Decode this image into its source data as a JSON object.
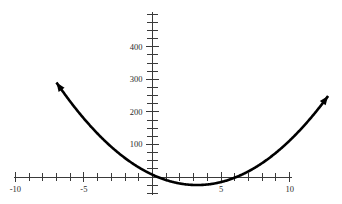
{
  "figure": {
    "title": "",
    "background_color": "#ffffff",
    "curve_color": "#000000",
    "axis_color": "#3a3a3a",
    "label_color": "#2b2b2b",
    "width": 342,
    "height": 204
  },
  "chart_data": {
    "type": "line",
    "title": "",
    "xlabel": "",
    "ylabel": "",
    "grid": false,
    "legend": null,
    "xlim": [
      -10.5,
      11.5
    ],
    "ylim": [
      -40,
      500
    ],
    "x_axis": {
      "labeled_ticks": [
        -10,
        -5,
        5,
        10
      ],
      "labeled_tick_texts": [
        "-10",
        "-5",
        "5",
        "10"
      ],
      "minor_tick_step": 1,
      "minor_ticks": [
        -10,
        -9,
        -8,
        -7,
        -6,
        -5,
        -4,
        -3,
        -2,
        -1,
        0,
        1,
        2,
        3,
        4,
        5,
        6,
        7,
        8,
        9,
        10
      ],
      "axis_value": 0
    },
    "y_axis": {
      "labeled_ticks": [
        100,
        200,
        300,
        400
      ],
      "labeled_tick_texts": [
        "100",
        "200",
        "300",
        "400"
      ],
      "minor_tick_step": 25,
      "minor_ticks": [
        -50,
        -25,
        25,
        50,
        75,
        100,
        125,
        150,
        175,
        200,
        225,
        250,
        275,
        300,
        325,
        350,
        375,
        400,
        425,
        450,
        475,
        500
      ],
      "axis_value": 0
    },
    "series": [
      {
        "name": "parabola",
        "equation": "y = 3x^2 - 19.5x + 7",
        "a": 3,
        "b": -19.5,
        "c": 7,
        "vertex": [
          3.25,
          -24.7
        ],
        "roots": [
          0.37,
          6.13
        ],
        "x_start": -7.0,
        "x_end": 12.8,
        "arrow_start": true,
        "arrow_end": true,
        "x": [
          -7.0,
          -6.0,
          -5.0,
          -4.0,
          -3.0,
          -2.0,
          -1.0,
          0.0,
          1.0,
          2.0,
          3.0,
          3.25,
          4.0,
          5.0,
          6.0,
          7.0,
          8.0,
          9.0,
          10.0,
          11.0,
          12.0,
          12.8
        ],
        "y": [
          290.5,
          232.0,
          179.5,
          133.0,
          92.5,
          58.0,
          29.5,
          7.0,
          -9.5,
          -20.0,
          -24.5,
          -24.7,
          -23.0,
          -15.5,
          -2.0,
          17.5,
          43.0,
          74.5,
          112.0,
          155.5,
          205.0,
          243.0
        ]
      }
    ]
  }
}
